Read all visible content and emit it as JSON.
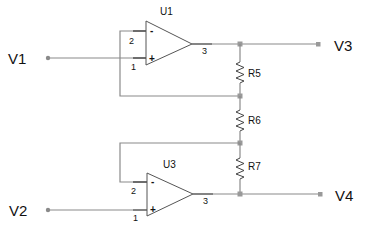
{
  "diagram": {
    "type": "circuit-schematic",
    "terminals": {
      "v1": "V1",
      "v2": "V2",
      "v3": "V3",
      "v4": "V4"
    },
    "opamps": [
      {
        "ref": "U1",
        "inverting_pin": "2",
        "noninverting_pin": "1",
        "output_pin": "3",
        "minus": "-",
        "plus": "+"
      },
      {
        "ref": "U3",
        "inverting_pin": "2",
        "noninverting_pin": "1",
        "output_pin": "3",
        "minus": "-",
        "plus": "+"
      }
    ],
    "resistors": [
      {
        "ref": "R5"
      },
      {
        "ref": "R6"
      },
      {
        "ref": "R7"
      }
    ]
  }
}
